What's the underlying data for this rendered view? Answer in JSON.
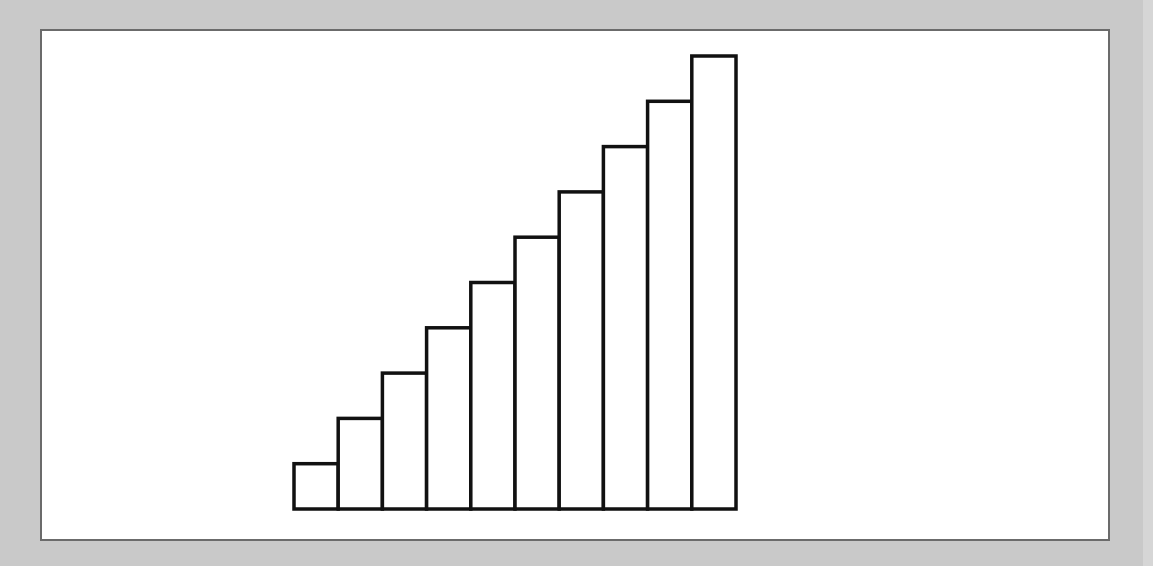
{
  "chart_data": {
    "type": "bar",
    "title": "",
    "xlabel": "",
    "ylabel": "",
    "categories": [
      "1",
      "2",
      "3",
      "4",
      "5",
      "6",
      "7",
      "8",
      "9",
      "10"
    ],
    "values": [
      1,
      2,
      3,
      4,
      5,
      6,
      7,
      8,
      9,
      10
    ],
    "ylim": [
      0,
      10
    ],
    "grid": false,
    "legend": null,
    "axes_visible": false,
    "bar_fill": "#ffffff",
    "bar_stroke": "#111111"
  },
  "colors": {
    "background": "#c9c9c9",
    "panel": "#ffffff",
    "panel_border": "#6b6b6b"
  }
}
